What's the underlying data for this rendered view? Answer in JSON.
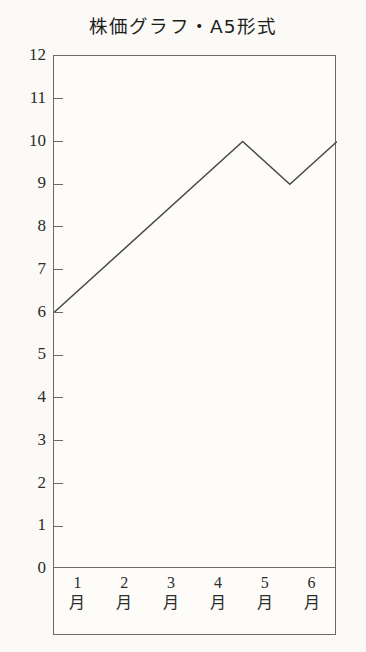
{
  "chart_data": {
    "type": "line",
    "title": "株価グラフ・A5形式",
    "xlabel": "",
    "ylabel": "",
    "ylim": [
      0,
      12
    ],
    "xlim": [
      0.5,
      6.5
    ],
    "grid": false,
    "legend": null,
    "y_ticks": [
      12,
      11,
      10,
      9,
      8,
      7,
      6,
      5,
      4,
      3,
      2,
      1,
      0
    ],
    "x_tick_labels": [
      "1月",
      "2月",
      "3月",
      "4月",
      "5月",
      "6月"
    ],
    "x_tick_numbers": [
      "1",
      "2",
      "3",
      "4",
      "5",
      "6"
    ],
    "x_tick_units": [
      "月",
      "月",
      "月",
      "月",
      "月",
      "月"
    ],
    "series": [
      {
        "name": "株価",
        "x": [
          0.5,
          4.5,
          5.5,
          6.5
        ],
        "values": [
          6,
          10,
          9,
          10
        ]
      }
    ],
    "line_color": "#4a4a44",
    "frame_color": "#6d6a60",
    "background": "#fbfaf7"
  }
}
